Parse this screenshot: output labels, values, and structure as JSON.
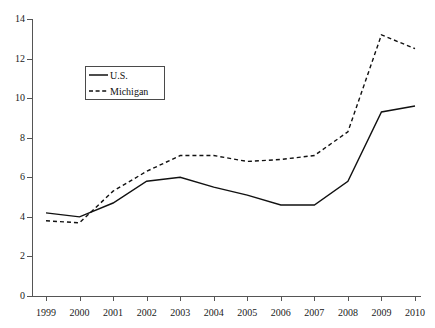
{
  "figure": {
    "top_remnant_text": "",
    "background_color": "#ffffff",
    "axis_color": "#555555",
    "series_color": "#111111"
  },
  "legend": {
    "position": "upper-left-inside",
    "entries": [
      {
        "label": "U.S.",
        "style": "solid"
      },
      {
        "label": "Michigan",
        "style": "dashed"
      }
    ]
  },
  "chart_data": {
    "type": "line",
    "title": "",
    "subtitle": "",
    "xlabel": "",
    "ylabel": "",
    "grid": false,
    "legend_position": "upper-left-inside",
    "x": [
      1999,
      2000,
      2001,
      2002,
      2003,
      2004,
      2005,
      2006,
      2007,
      2008,
      2009,
      2010
    ],
    "categories": [
      "1999",
      "2000",
      "2001",
      "2002",
      "2003",
      "2004",
      "2005",
      "2006",
      "2007",
      "2008",
      "2009",
      "2010"
    ],
    "xlim": [
      1999,
      2010
    ],
    "ylim": [
      0,
      14
    ],
    "yticks": [
      0,
      2,
      4,
      6,
      8,
      10,
      12,
      14
    ],
    "ytick_labels": [
      "0",
      "2",
      "4",
      "6",
      "8",
      "10",
      "12",
      "14"
    ],
    "series": [
      {
        "name": "U.S.",
        "style": "solid",
        "color": "#111111",
        "values": [
          4.2,
          4.0,
          4.7,
          5.8,
          6.0,
          5.5,
          5.1,
          4.6,
          4.6,
          5.8,
          9.3,
          9.6
        ]
      },
      {
        "name": "Michigan",
        "style": "dashed",
        "color": "#111111",
        "values": [
          3.8,
          3.7,
          5.3,
          6.3,
          7.1,
          7.1,
          6.8,
          6.9,
          7.1,
          8.3,
          13.2,
          12.5
        ]
      }
    ]
  }
}
